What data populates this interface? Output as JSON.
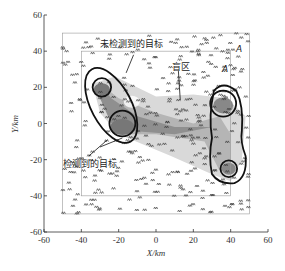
{
  "figure": {
    "xlabel": "X/km",
    "ylabel": "Y/km",
    "x_ticks": [
      "-60",
      "-40",
      "-20",
      "0",
      "20",
      "40",
      "60"
    ],
    "y_ticks": [
      "60",
      "40",
      "20",
      "0",
      "-20",
      "-40",
      "-60"
    ],
    "x_tick_values": [
      -60,
      -40,
      -20,
      0,
      20,
      40,
      60
    ],
    "y_tick_values": [
      60,
      40,
      20,
      0,
      -20,
      -40,
      -60
    ],
    "xlim": [
      -60,
      60
    ],
    "ylim": [
      -60,
      60
    ],
    "regions": {
      "outer_box": [
        -50,
        50
      ],
      "inner_box": [
        -40,
        40
      ]
    },
    "annotations": {
      "undetected": "未检测到的目标",
      "blind_zone": "盲区",
      "detected": "检测到的目标",
      "marker_a1": "A",
      "marker_a2": "A"
    },
    "clusters": [
      {
        "name": "left-cluster",
        "center": [
          -20,
          10
        ],
        "circles": [
          {
            "c": [
              -29,
              20
            ],
            "r": 5
          },
          {
            "c": [
              -18,
              0
            ],
            "r": 7
          }
        ]
      },
      {
        "name": "right-cluster",
        "center": [
          39,
          -8
        ],
        "circles": [
          {
            "c": [
              36,
              11
            ],
            "r": 7
          },
          {
            "c": [
              39,
              -25
            ],
            "r": 4.5
          }
        ]
      }
    ]
  },
  "chart_data": {
    "type": "scatter",
    "title": "",
    "xlabel": "X/km",
    "ylabel": "Y/km",
    "xlim": [
      -60,
      60
    ],
    "ylim": [
      -60,
      60
    ],
    "annotations": [
      "未检测到的目标",
      "盲区",
      "检测到的目标",
      "A",
      "A"
    ],
    "target_clusters": [
      {
        "label": "detected-left",
        "x": -24,
        "y": 10
      },
      {
        "label": "detected-right",
        "x": 38,
        "y": -8
      }
    ]
  }
}
